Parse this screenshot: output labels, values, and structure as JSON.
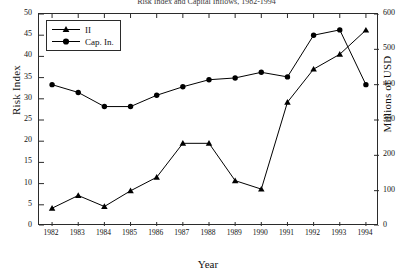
{
  "chart_data": {
    "type": "line",
    "title": "Risk Index and Capital Inflows, 1982-1994",
    "xlabel": "Year",
    "ylabel": "Risk Index",
    "ylabel_right": "Millions of USD",
    "categories": [
      "1982",
      "1983",
      "1984",
      "1985",
      "1986",
      "1987",
      "1988",
      "1989",
      "1990",
      "1991",
      "1992",
      "1993",
      "1994"
    ],
    "ylim": [
      0,
      50
    ],
    "ylim_right": [
      0,
      600
    ],
    "yticks": [
      0,
      5,
      10,
      15,
      20,
      25,
      30,
      35,
      40,
      45,
      50
    ],
    "yticks_right": [
      0,
      100,
      200,
      300,
      400,
      500,
      600
    ],
    "grid": false,
    "legend_position": "top-left",
    "series": [
      {
        "name": "II",
        "axis": "left",
        "marker": "triangle",
        "color": "#000000",
        "values": [
          4.2,
          7.2,
          4.6,
          8.3,
          11.5,
          19.5,
          19.5,
          10.7,
          8.7,
          29.2,
          37.0,
          40.5,
          46.2
        ]
      },
      {
        "name": "Cap. In.",
        "axis": "right",
        "marker": "circle",
        "color": "#000000",
        "values": [
          400,
          378,
          338,
          338,
          370,
          394,
          414,
          419,
          435,
          422,
          540,
          555,
          400
        ]
      }
    ]
  },
  "legend": {
    "items": [
      {
        "label": "II",
        "marker": "triangle-marker-icon"
      },
      {
        "label": "Cap. In.",
        "marker": "circle-marker-icon"
      }
    ]
  }
}
